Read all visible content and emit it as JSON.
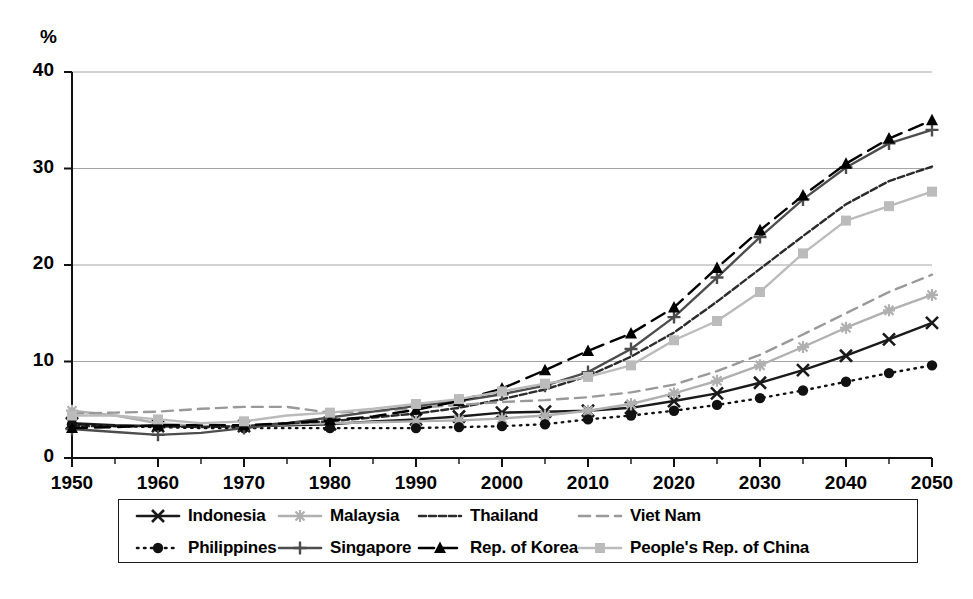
{
  "chart_data": {
    "type": "line",
    "title": "",
    "xlabel": "",
    "ylabel": "%",
    "yunit_label": "%",
    "xlim": [
      1950,
      2050
    ],
    "ylim": [
      0,
      40
    ],
    "ytick_labels": [
      "0",
      "10",
      "20",
      "30",
      "40"
    ],
    "yticks": [
      0,
      10,
      20,
      30,
      40
    ],
    "xtick_labels": [
      "1950",
      "1960",
      "1970",
      "1980",
      "1990",
      "2000",
      "2010",
      "2020",
      "2030",
      "2040",
      "2050"
    ],
    "xticks": [
      1950,
      1960,
      1970,
      1980,
      1990,
      2000,
      2010,
      2020,
      2030,
      2040,
      2050
    ],
    "minor_xtick_interval": 5,
    "grid": "horizontal",
    "legend_position": "below",
    "x": [
      1950,
      1955,
      1960,
      1965,
      1970,
      1975,
      1980,
      1985,
      1990,
      1995,
      2000,
      2005,
      2010,
      2015,
      2020,
      2025,
      2030,
      2035,
      2040,
      2045,
      2050
    ],
    "series": [
      {
        "name": "Indonesia",
        "color": "#1a1a1a",
        "dash": "solid",
        "marker": "x",
        "values": [
          3.6,
          3.4,
          3.3,
          3.3,
          3.3,
          3.4,
          3.5,
          3.8,
          4.0,
          4.3,
          4.7,
          4.8,
          4.9,
          5.2,
          5.9,
          6.7,
          7.8,
          9.1,
          10.6,
          12.3,
          14.0
        ]
      },
      {
        "name": "Malaysia",
        "color": "#b0b0b0",
        "dash": "solid",
        "marker": "star",
        "values": [
          4.9,
          4.4,
          3.6,
          3.3,
          3.3,
          3.5,
          3.6,
          3.7,
          3.8,
          3.9,
          4.1,
          4.4,
          4.9,
          5.6,
          6.7,
          8.0,
          9.6,
          11.5,
          13.5,
          15.3,
          16.9
        ]
      },
      {
        "name": "Thailand",
        "color": "#2b2b2b",
        "dash": "dashdot",
        "marker": "none",
        "values": [
          3.3,
          3.3,
          3.3,
          3.2,
          3.3,
          3.6,
          3.8,
          4.2,
          4.6,
          5.2,
          6.1,
          7.1,
          8.5,
          10.5,
          13.0,
          16.2,
          19.6,
          23.0,
          26.3,
          28.7,
          30.2
        ]
      },
      {
        "name": "Viet Nam",
        "color": "#999999",
        "dash": "dashed",
        "marker": "none",
        "values": [
          4.6,
          4.7,
          4.8,
          5.1,
          5.3,
          5.3,
          4.7,
          4.8,
          5.2,
          5.5,
          5.8,
          6.0,
          6.3,
          6.8,
          7.6,
          9.0,
          10.7,
          12.8,
          15.0,
          17.2,
          19.0
        ]
      },
      {
        "name": "Philippines",
        "color": "#111111",
        "dash": "dotted",
        "marker": "circle",
        "values": [
          3.5,
          3.3,
          3.2,
          3.1,
          3.1,
          3.1,
          3.1,
          3.1,
          3.1,
          3.2,
          3.3,
          3.5,
          4.0,
          4.4,
          4.9,
          5.5,
          6.2,
          7.0,
          7.9,
          8.8,
          9.6
        ]
      },
      {
        "name": "Singapore",
        "color": "#4d4d4d",
        "dash": "solid",
        "marker": "plus",
        "values": [
          3.0,
          2.7,
          2.4,
          2.6,
          3.1,
          3.6,
          4.2,
          4.8,
          5.4,
          5.9,
          6.6,
          7.5,
          8.9,
          11.3,
          14.6,
          18.7,
          22.9,
          26.8,
          30.1,
          32.6,
          34.0
        ]
      },
      {
        "name": "Rep. of Korea",
        "color": "#000000",
        "dash": "longdash",
        "marker": "triangle",
        "values": [
          3.1,
          3.2,
          3.4,
          3.4,
          3.4,
          3.6,
          3.9,
          4.3,
          5.0,
          5.9,
          7.2,
          9.1,
          11.1,
          12.9,
          15.6,
          19.7,
          23.6,
          27.2,
          30.5,
          33.1,
          35.0
        ]
      },
      {
        "name": "People's Rep. of China",
        "color": "#bbbbbb",
        "dash": "solid",
        "marker": "square",
        "values": [
          4.4,
          4.4,
          4.0,
          3.6,
          3.8,
          4.4,
          4.7,
          5.1,
          5.6,
          6.1,
          6.9,
          7.7,
          8.4,
          9.6,
          12.2,
          14.2,
          17.2,
          21.2,
          24.6,
          26.1,
          27.6
        ]
      }
    ]
  },
  "legend": {
    "rows": [
      [
        {
          "label": "Indonesia"
        },
        {
          "label": "Malaysia"
        },
        {
          "label": "Thailand"
        },
        {
          "label": "Viet Nam"
        }
      ],
      [
        {
          "label": "Philippines"
        },
        {
          "label": "Singapore"
        },
        {
          "label": "Rep. of Korea"
        },
        {
          "label": "People's Rep. of China"
        }
      ]
    ]
  },
  "axes": {
    "unit": "%"
  }
}
